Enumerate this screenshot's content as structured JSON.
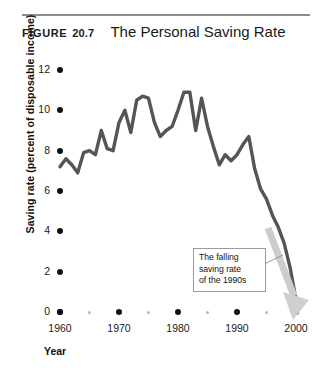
{
  "header": {
    "figure_word": "FIGURE",
    "figure_number": "20.7",
    "title": "The Personal Saving Rate"
  },
  "annotation": {
    "line1": "The falling",
    "line2": "saving rate",
    "line3": "of the 1990s"
  },
  "chart_data": {
    "type": "line",
    "title": "The Personal Saving Rate",
    "xlabel": "Year",
    "ylabel": "Saving rate (percent of disposable income)",
    "xlim": [
      1960,
      2000
    ],
    "ylim": [
      0,
      12
    ],
    "yticks": [
      0,
      2,
      4,
      6,
      8,
      10,
      12
    ],
    "ytick_labels": [
      "0",
      "2",
      "4",
      "6",
      "8",
      "10",
      "12"
    ],
    "xticks": [
      1960,
      1970,
      1980,
      1990,
      2000
    ],
    "xtick_labels": [
      "1960",
      "1970",
      "1980",
      "1990",
      "2000"
    ],
    "xticks_minor": [
      1965,
      1975,
      1985,
      1995
    ],
    "grid": false,
    "legend": false,
    "line_color": "#555555",
    "annotation_arrow_color": "#c9c9c9",
    "series": [
      {
        "name": "Personal saving rate",
        "x": [
          1960,
          1961,
          1962,
          1963,
          1964,
          1965,
          1966,
          1967,
          1968,
          1969,
          1970,
          1971,
          1972,
          1973,
          1974,
          1975,
          1976,
          1977,
          1978,
          1979,
          1980,
          1981,
          1982,
          1983,
          1984,
          1985,
          1986,
          1987,
          1988,
          1989,
          1990,
          1991,
          1992,
          1993,
          1994,
          1995,
          1996,
          1997,
          1998,
          1999,
          2000
        ],
        "values": [
          7.2,
          7.6,
          7.3,
          6.9,
          7.9,
          8.0,
          7.8,
          9.0,
          8.1,
          8.0,
          9.4,
          10.0,
          8.9,
          10.5,
          10.7,
          10.6,
          9.4,
          8.7,
          9.0,
          9.2,
          10.0,
          10.9,
          10.9,
          9.0,
          10.6,
          9.2,
          8.2,
          7.3,
          7.8,
          7.5,
          7.8,
          8.3,
          8.7,
          7.1,
          6.1,
          5.6,
          4.8,
          4.2,
          3.4,
          2.2,
          0.6
        ]
      }
    ],
    "annotations": [
      {
        "text": "The falling saving rate of the 1990s",
        "points_to": "declining segment 1992-2000",
        "arrow": "down-right gray arrow overlay"
      }
    ]
  }
}
